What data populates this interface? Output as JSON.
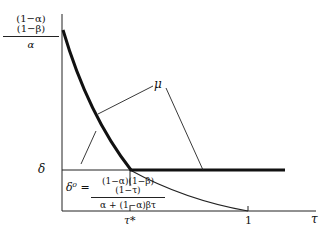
{
  "diagram": {
    "y_axis_top_label": {
      "numerator": "(1−α)(1−β)",
      "denominator": "α"
    },
    "y_axis_level_label": "δ",
    "x_axis_label": "τ",
    "x_ticks": [
      {
        "label": "τ*"
      },
      {
        "label": "1"
      }
    ],
    "curve_label": "μ",
    "formula": {
      "lhs": "δ⁰ =",
      "numerator": "(1−α)(1−β)(1−τ)",
      "denominator": "α + (1−α)βτ"
    },
    "colors": {
      "line": "#111111",
      "background": "#ffffff"
    }
  }
}
